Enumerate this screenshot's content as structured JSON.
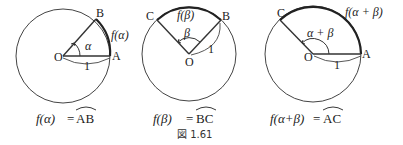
{
  "figure_label": "図 1.61",
  "diagrams": [
    {
      "id": "alpha",
      "points": {
        "center": "O",
        "p1": "A",
        "p2": "B"
      },
      "radius_label": "1",
      "angle_label": "α",
      "arc_label": "f(α)",
      "caption_lhs": "f(α)",
      "caption_eq": "=",
      "caption_rhs": "AB"
    },
    {
      "id": "beta",
      "points": {
        "center": "O",
        "p1": "B",
        "p2": "C"
      },
      "radius_label": "1",
      "angle_label": "β",
      "arc_label": "f(β)",
      "caption_lhs": "f(β)",
      "caption_eq": "=",
      "caption_rhs": "BC"
    },
    {
      "id": "alpha-plus-beta",
      "points": {
        "center": "O",
        "p1": "A",
        "p2": "C"
      },
      "radius_label": "1",
      "angle_label": "α + β",
      "arc_label": "f(α + β)",
      "caption_lhs": "f(α+β)",
      "caption_eq": "=",
      "caption_rhs": "AC"
    }
  ],
  "colors": {
    "stroke": "#333333",
    "arc": "#222222",
    "text": "#222222"
  }
}
